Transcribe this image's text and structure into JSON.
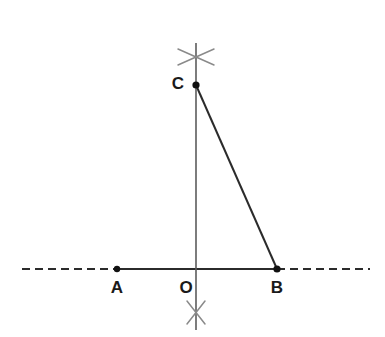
{
  "figure": {
    "kind": "geometry-construction",
    "canvas": {
      "width": 385,
      "height": 337,
      "background": "#ffffff"
    }
  },
  "colors": {
    "line_dark": "#2b2b2b",
    "line_medium": "#444444",
    "arc_gray": "#8a8a8a",
    "point_fill": "#111111",
    "label_color": "#1a1a1a",
    "background": "#ffffff"
  },
  "points": [
    {
      "name": "A",
      "label": "A",
      "x": 117,
      "y": 269,
      "label_x": 117,
      "label_y": 289,
      "dot": true,
      "dot_r": 3.2
    },
    {
      "name": "O",
      "label": "O",
      "x": 196,
      "y": 269,
      "label_x": 186,
      "label_y": 289,
      "dot": false,
      "dot_r": 0
    },
    {
      "name": "B",
      "label": "B",
      "x": 277,
      "y": 269,
      "label_x": 277,
      "label_y": 289,
      "dot": true,
      "dot_r": 3.6
    },
    {
      "name": "C",
      "label": "C",
      "x": 196,
      "y": 85,
      "label_x": 178,
      "label_y": 85,
      "dot": true,
      "dot_r": 3.6
    }
  ],
  "segments": [
    {
      "name": "baseline-dash-left",
      "style": "dashed",
      "x1": 22,
      "y1": 269,
      "x2": 117,
      "y2": 269,
      "stroke": "#2b2b2b",
      "width": 2.0,
      "dash": "8 5"
    },
    {
      "name": "baseline-solid-AB",
      "style": "solid",
      "x1": 117,
      "y1": 269,
      "x2": 277,
      "y2": 269,
      "stroke": "#2b2b2b",
      "width": 2.0,
      "dash": ""
    },
    {
      "name": "baseline-dash-right",
      "style": "dashed",
      "x1": 277,
      "y1": 269,
      "x2": 370,
      "y2": 269,
      "stroke": "#2b2b2b",
      "width": 2.0,
      "dash": "8 5"
    },
    {
      "name": "perpendicular-vertical",
      "style": "solid",
      "x1": 196,
      "y1": 43,
      "x2": 196,
      "y2": 330,
      "stroke": "#5c5c5c",
      "width": 1.6,
      "dash": ""
    },
    {
      "name": "hypotenuse-CB",
      "style": "solid",
      "x1": 196,
      "y1": 85,
      "x2": 277,
      "y2": 269,
      "stroke": "#2b2b2b",
      "width": 2.0,
      "dash": ""
    }
  ],
  "arc_marks": [
    {
      "name": "arc-intersection-top",
      "cx": 196,
      "cy": 57,
      "stroke": "#8a8a8a",
      "width": 1.5,
      "strokes": [
        {
          "x1": 178,
          "y1": 49,
          "x2": 214,
          "y2": 65
        },
        {
          "x1": 178,
          "y1": 65,
          "x2": 214,
          "y2": 49
        }
      ]
    },
    {
      "name": "arc-intersection-bottom",
      "cx": 196,
      "cy": 312,
      "stroke": "#8a8a8a",
      "width": 1.5,
      "strokes": [
        {
          "x1": 187,
          "y1": 301,
          "x2": 205,
          "y2": 324
        },
        {
          "x1": 205,
          "y1": 301,
          "x2": 187,
          "y2": 324
        }
      ]
    }
  ],
  "labels": {
    "a": "A",
    "o": "O",
    "b": "B",
    "c": "C"
  }
}
